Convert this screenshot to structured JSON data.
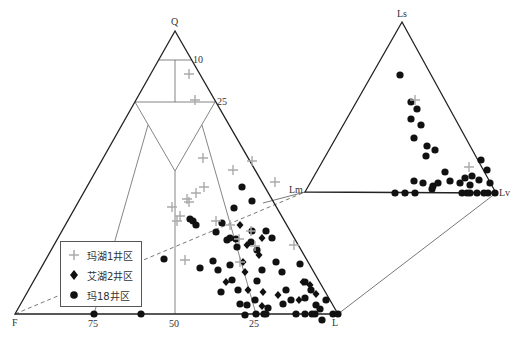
{
  "chart_data": {
    "type": "ternary",
    "title": "",
    "main_triangle": {
      "vertices": {
        "top": "Q",
        "left": "F",
        "right": "L"
      },
      "tick_labels": {
        "right_edge": [
          "10",
          "25"
        ],
        "bottom_edge": [
          "75",
          "50",
          "25"
        ]
      }
    },
    "inset_triangle": {
      "vertices": {
        "top": "Ls",
        "left": "Lm",
        "right": "Lv"
      }
    },
    "legend": [
      {
        "name": "玛湖1井区",
        "marker": "plus",
        "color": "#aaaaaa"
      },
      {
        "name": "艾湖2井区",
        "marker": "diamond",
        "color": "#111111"
      },
      {
        "name": "玛18井区",
        "marker": "circle",
        "color": "#111111"
      }
    ],
    "series": [
      {
        "name": "玛湖1井区",
        "points_px": [
          [
            189,
            74
          ],
          [
            195,
            100
          ],
          [
            203,
            158
          ],
          [
            233,
            170
          ],
          [
            204,
            187
          ],
          [
            252,
            161
          ],
          [
            275,
            182
          ],
          [
            196,
            193
          ],
          [
            187,
            199
          ],
          [
            189,
            202
          ],
          [
            172,
            207
          ],
          [
            180,
            216
          ],
          [
            177,
            221
          ],
          [
            216,
            221
          ],
          [
            251,
            231
          ],
          [
            239,
            239
          ],
          [
            255,
            246
          ],
          [
            240,
            262
          ],
          [
            294,
            245
          ],
          [
            185,
            260
          ],
          [
            230,
            225
          ],
          [
            415,
            100
          ],
          [
            469,
            167
          ]
        ]
      },
      {
        "name": "艾湖2井区",
        "points_px": [
          [
            240,
            225
          ],
          [
            262,
            238
          ],
          [
            247,
            245
          ],
          [
            259,
            255
          ],
          [
            243,
            262
          ],
          [
            245,
            272
          ],
          [
            226,
            282
          ],
          [
            248,
            290
          ],
          [
            263,
            292
          ],
          [
            278,
            295
          ],
          [
            262,
            306
          ],
          [
            299,
            300
          ],
          [
            310,
            285
          ],
          [
            316,
            294
          ],
          [
            303,
            282
          ]
        ]
      },
      {
        "name": "玛18井区",
        "points_px": [
          [
            242,
            187
          ],
          [
            252,
            201
          ],
          [
            234,
            208
          ],
          [
            190,
            219
          ],
          [
            193,
            221
          ],
          [
            196,
            225
          ],
          [
            222,
            223
          ],
          [
            236,
            239
          ],
          [
            252,
            231
          ],
          [
            266,
            231
          ],
          [
            272,
            238
          ],
          [
            230,
            238
          ],
          [
            237,
            247
          ],
          [
            251,
            242
          ],
          [
            257,
            250
          ],
          [
            216,
            232
          ],
          [
            227,
            240
          ],
          [
            164,
            259
          ],
          [
            213,
            261
          ],
          [
            230,
            265
          ],
          [
            200,
            268
          ],
          [
            218,
            270
          ],
          [
            232,
            280
          ],
          [
            221,
            292
          ],
          [
            238,
            290
          ],
          [
            240,
            304
          ],
          [
            255,
            300
          ],
          [
            262,
            270
          ],
          [
            257,
            281
          ],
          [
            276,
            262
          ],
          [
            282,
            272
          ],
          [
            286,
            290
          ],
          [
            283,
            304
          ],
          [
            300,
            264
          ],
          [
            305,
            282
          ],
          [
            311,
            290
          ],
          [
            305,
            298
          ],
          [
            291,
            300
          ],
          [
            268,
            308
          ],
          [
            316,
            305
          ],
          [
            320,
            309
          ],
          [
            326,
            300
          ],
          [
            322,
            320
          ],
          [
            312,
            314
          ],
          [
            333,
            314
          ],
          [
            338,
            314
          ],
          [
            256,
            314
          ],
          [
            264,
            314
          ],
          [
            266,
            314
          ],
          [
            305,
            314
          ],
          [
            315,
            314
          ],
          [
            141,
            314
          ],
          [
            94,
            314
          ],
          [
            247,
            305
          ],
          [
            245,
            315
          ],
          [
            296,
            314
          ],
          [
            400,
            75
          ],
          [
            411,
            102
          ],
          [
            417,
            109
          ],
          [
            411,
            119
          ],
          [
            421,
            125
          ],
          [
            414,
            138
          ],
          [
            427,
            146
          ],
          [
            435,
            150
          ],
          [
            426,
            156
          ],
          [
            445,
            172
          ],
          [
            438,
            183
          ],
          [
            450,
            181
          ],
          [
            460,
            183
          ],
          [
            465,
            178
          ],
          [
            472,
            176
          ],
          [
            470,
            185
          ],
          [
            479,
            180
          ],
          [
            490,
            183
          ],
          [
            477,
            193
          ],
          [
            470,
            193
          ],
          [
            484,
            193
          ],
          [
            488,
            193
          ],
          [
            495,
            193
          ],
          [
            462,
            193
          ],
          [
            467,
            193
          ],
          [
            414,
            181
          ],
          [
            423,
            183
          ],
          [
            433,
            186
          ],
          [
            395,
            193
          ],
          [
            405,
            193
          ],
          [
            415,
            193
          ],
          [
            432,
            189
          ],
          [
            481,
            160
          ],
          [
            487,
            170
          ]
        ]
      }
    ]
  }
}
